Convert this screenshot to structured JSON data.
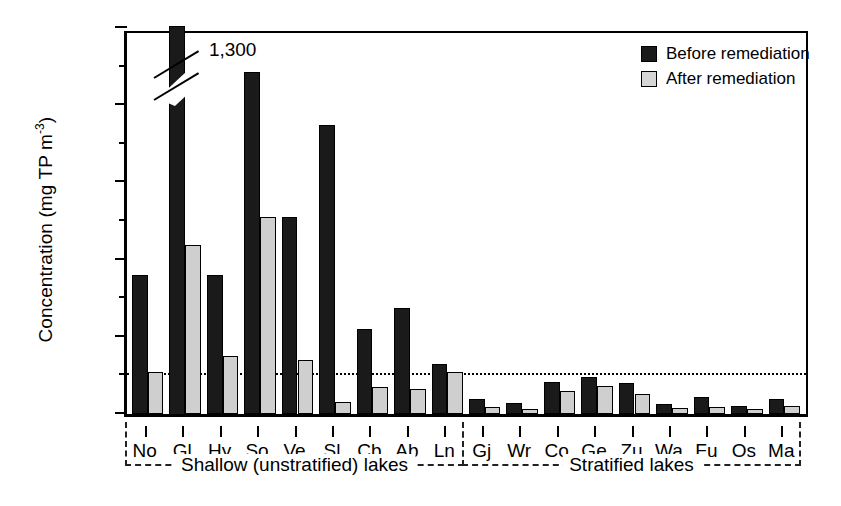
{
  "chart_data": {
    "type": "bar",
    "title": "",
    "xlabel": "",
    "ylabel": "Concentration (mg TP m",
    "ylabel_exponent": "-3",
    "ylabel_suffix": ")",
    "ylim": [
      0,
      1000
    ],
    "yticks": [
      0,
      200,
      400,
      600,
      800,
      1000
    ],
    "ytick_labels": [
      "0",
      "200",
      "400",
      "600",
      "800",
      "1,000"
    ],
    "minor_ticks": [
      100,
      300,
      500,
      700,
      900
    ],
    "grid": false,
    "reference_line": {
      "value": 100,
      "style": "dotted"
    },
    "legend_position": "top-right",
    "categories": [
      "No",
      "Gl",
      "Hy",
      "So",
      "Ve",
      "Sl",
      "Cb",
      "Ab",
      "Ln",
      "Gj",
      "Wr",
      "Co",
      "Ge",
      "Zu",
      "Wa",
      "Fu",
      "Os",
      "Ma"
    ],
    "series": [
      {
        "name": "Before remediation",
        "color": "#1a1a1a",
        "values": [
          360,
          1300,
          360,
          885,
          510,
          750,
          220,
          275,
          130,
          40,
          28,
          82,
          95,
          80,
          25,
          45,
          22,
          38
        ]
      },
      {
        "name": "After remediation",
        "color": "#cfcfcf",
        "values": [
          110,
          437,
          150,
          510,
          140,
          30,
          70,
          65,
          110,
          18,
          12,
          60,
          72,
          52,
          15,
          18,
          13,
          20
        ]
      }
    ],
    "annotations": [
      {
        "text": "1,300",
        "category": "Gl",
        "series": "Before remediation",
        "note": "value exceeds axis; bar broken"
      }
    ],
    "groups": [
      {
        "label": "Shallow (unstratified) lakes",
        "categories": [
          "No",
          "Gl",
          "Hy",
          "So",
          "Ve",
          "Sl",
          "Cb",
          "Ab",
          "Ln"
        ]
      },
      {
        "label": "Stratified lakes",
        "categories": [
          "Gj",
          "Wr",
          "Co",
          "Ge",
          "Zu",
          "Wa",
          "Fu",
          "Os",
          "Ma"
        ]
      }
    ]
  },
  "legend": {
    "items": [
      {
        "label": "Before remediation",
        "swatch": "before"
      },
      {
        "label": "After remediation",
        "swatch": "after"
      }
    ]
  }
}
